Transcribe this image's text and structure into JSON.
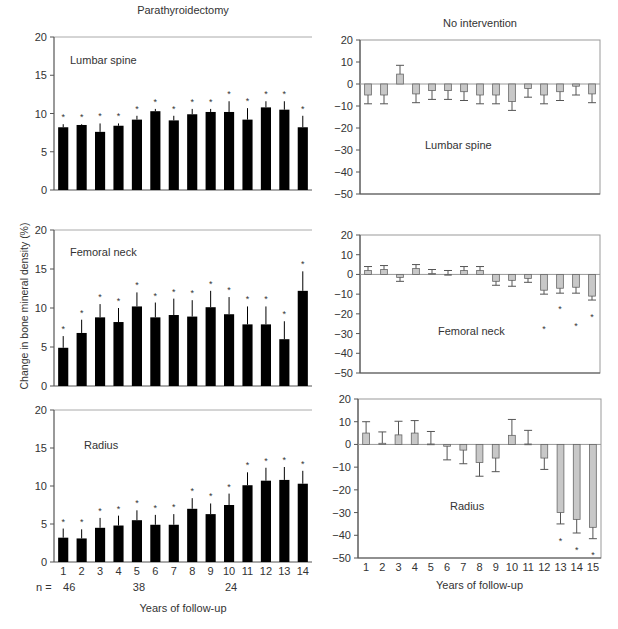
{
  "figure": {
    "left_column_title": "Parathyroidectomy",
    "right_column_title": "No intervention",
    "y_axis_label": "Change in bone mineral density (%)",
    "x_axis_label": "Years of follow-up",
    "n_label": "n =",
    "n_values": [
      {
        "year": 1,
        "label": "46"
      },
      {
        "year": 5,
        "label": "38"
      },
      {
        "year": 10,
        "label": "24"
      }
    ]
  },
  "chart_data": [
    {
      "type": "bar",
      "panel": "left-top",
      "title": "Lumbar spine",
      "group": "Parathyroidectomy",
      "categories": [
        1,
        2,
        3,
        4,
        5,
        6,
        7,
        8,
        9,
        10,
        11,
        12,
        13,
        14
      ],
      "values": [
        8.2,
        8.5,
        7.6,
        8.4,
        9.2,
        10.3,
        9.1,
        9.9,
        10.2,
        10.2,
        9.2,
        10.8,
        10.5,
        8.2
      ],
      "error": [
        0.4,
        0.1,
        1.1,
        0.3,
        0.5,
        0.3,
        0.6,
        0.7,
        0.4,
        1.4,
        1.5,
        0.8,
        1.1,
        1.5
      ],
      "significant": [
        true,
        true,
        true,
        true,
        true,
        true,
        true,
        true,
        true,
        true,
        true,
        true,
        true,
        true
      ],
      "xlabel": "",
      "ylabel": "Change in bone mineral density (%)",
      "ylim": [
        0,
        20
      ],
      "yticks": [
        0,
        5,
        10,
        15,
        20
      ],
      "bar_color": "#000000",
      "grid": false
    },
    {
      "type": "bar",
      "panel": "left-middle",
      "title": "Femoral neck",
      "group": "Parathyroidectomy",
      "categories": [
        1,
        2,
        3,
        4,
        5,
        6,
        7,
        8,
        9,
        10,
        11,
        12,
        13,
        14
      ],
      "values": [
        4.9,
        6.8,
        8.8,
        8.2,
        10.2,
        8.8,
        9.1,
        8.9,
        10.1,
        9.2,
        7.9,
        7.9,
        6.0,
        12.2
      ],
      "error": [
        1.5,
        1.7,
        1.7,
        1.8,
        1.8,
        1.9,
        2.1,
        2.1,
        2.1,
        2.2,
        2.3,
        2.3,
        2.3,
        2.5
      ],
      "significant": [
        true,
        true,
        true,
        true,
        true,
        true,
        true,
        true,
        true,
        true,
        true,
        true,
        true,
        true
      ],
      "xlabel": "",
      "ylabel": "Change in bone mineral density (%)",
      "ylim": [
        0,
        20
      ],
      "yticks": [
        0,
        5,
        10,
        15,
        20
      ],
      "bar_color": "#000000",
      "grid": false
    },
    {
      "type": "bar",
      "panel": "left-bottom",
      "title": "Radius",
      "group": "Parathyroidectomy",
      "categories": [
        1,
        2,
        3,
        4,
        5,
        6,
        7,
        8,
        9,
        10,
        11,
        12,
        13,
        14
      ],
      "values": [
        3.2,
        3.1,
        4.5,
        4.8,
        5.5,
        4.9,
        4.9,
        7.0,
        6.3,
        7.5,
        10.1,
        10.7,
        10.8,
        10.3
      ],
      "error": [
        1.2,
        1.2,
        1.3,
        1.3,
        1.3,
        1.3,
        1.4,
        1.4,
        1.4,
        1.5,
        1.7,
        1.7,
        1.7,
        1.7
      ],
      "significant": [
        true,
        true,
        true,
        true,
        true,
        true,
        true,
        true,
        true,
        true,
        true,
        true,
        true,
        true
      ],
      "xlabel": "Years of follow-up",
      "ylabel": "Change in bone mineral density (%)",
      "ylim": [
        0,
        20
      ],
      "yticks": [
        0,
        5,
        10,
        15,
        20
      ],
      "bar_color": "#000000",
      "grid": false
    },
    {
      "type": "bar",
      "panel": "right-top",
      "title": "Lumbar spine",
      "group": "No intervention",
      "categories": [
        1,
        2,
        3,
        4,
        5,
        6,
        7,
        8,
        9,
        10,
        11,
        12,
        13,
        14,
        15
      ],
      "values": [
        -5.0,
        -5.0,
        4.5,
        -4.5,
        -3.0,
        -3.0,
        -3.5,
        -5.0,
        -5.0,
        -8.0,
        -2.0,
        -5.0,
        -3.5,
        -1.0,
        -4.5
      ],
      "error": [
        4.0,
        4.0,
        4.0,
        4.0,
        4.0,
        4.0,
        4.0,
        4.0,
        4.0,
        4.0,
        4.0,
        4.0,
        4.0,
        4.0,
        4.0
      ],
      "significant": [
        false,
        false,
        false,
        false,
        false,
        false,
        false,
        false,
        false,
        false,
        false,
        false,
        false,
        false,
        false
      ],
      "xlabel": "",
      "ylabel": "",
      "ylim": [
        -50,
        20
      ],
      "yticks": [
        -50,
        -40,
        -30,
        -20,
        -10,
        0,
        10,
        20
      ],
      "bar_color": "#c8c8c8",
      "grid": false
    },
    {
      "type": "bar",
      "panel": "right-middle",
      "title": "Femoral neck",
      "group": "No intervention",
      "categories": [
        1,
        2,
        3,
        4,
        5,
        6,
        7,
        8,
        9,
        10,
        11,
        12,
        13,
        14,
        15
      ],
      "values": [
        2.0,
        2.5,
        -1.5,
        3.0,
        0.5,
        0.0,
        2.0,
        2.0,
        -3.5,
        -3.0,
        -2.0,
        -8.0,
        -7.0,
        -6.5,
        -11.0
      ],
      "error": [
        2.0,
        2.0,
        2.0,
        2.0,
        2.0,
        2.0,
        2.0,
        2.0,
        2.0,
        3.0,
        2.0,
        2.0,
        2.5,
        3.0,
        2.0
      ],
      "significant": [
        false,
        false,
        false,
        false,
        false,
        false,
        false,
        false,
        false,
        false,
        false,
        true,
        true,
        true,
        true
      ],
      "xlabel": "",
      "ylabel": "",
      "ylim": [
        -50,
        20
      ],
      "yticks": [
        -50,
        -40,
        -30,
        -20,
        -10,
        0,
        10,
        20
      ],
      "bar_color": "#c8c8c8",
      "grid": false
    },
    {
      "type": "bar",
      "panel": "right-bottom",
      "title": "Radius",
      "group": "No intervention",
      "categories": [
        1,
        2,
        3,
        4,
        5,
        6,
        7,
        8,
        9,
        10,
        11,
        12,
        13,
        14,
        15
      ],
      "values": [
        5.0,
        0.5,
        4.2,
        5.0,
        0.2,
        -0.8,
        -2.5,
        -8.0,
        -6.0,
        4.0,
        0.2,
        -6.0,
        -30.0,
        -33.0,
        -36.5
      ],
      "error": [
        5.0,
        5.0,
        6.0,
        5.5,
        5.5,
        6.0,
        6.0,
        6.0,
        6.0,
        7.0,
        6.0,
        5.0,
        5.0,
        6.0,
        5.0
      ],
      "significant": [
        false,
        false,
        false,
        false,
        false,
        false,
        false,
        false,
        false,
        false,
        false,
        false,
        true,
        true,
        true
      ],
      "xlabel": "Years of follow-up",
      "ylabel": "",
      "ylim": [
        -50,
        20
      ],
      "yticks": [
        -50,
        -40,
        -30,
        -20,
        -10,
        0,
        10,
        20
      ],
      "bar_color": "#c8c8c8",
      "grid": false
    }
  ]
}
